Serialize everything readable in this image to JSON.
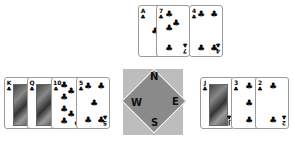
{
  "table": {
    "background": "#ffffff",
    "compass": {
      "north": "N",
      "south": "S",
      "east": "E",
      "west": "W",
      "outer_color": "#bdbdbd",
      "diamond_color": "#8a8a8a"
    }
  },
  "hands": {
    "north": {
      "cards": [
        {
          "rank": "A",
          "suit": "♣"
        },
        {
          "rank": "7",
          "suit": "♣"
        },
        {
          "rank": "4",
          "suit": "♣"
        }
      ]
    },
    "west": {
      "cards": [
        {
          "rank": "K",
          "suit": "♣"
        },
        {
          "rank": "Q",
          "suit": "♣"
        },
        {
          "rank": "10",
          "suit": "♣"
        },
        {
          "rank": "5",
          "suit": "♣"
        }
      ]
    },
    "east": {
      "cards": [
        {
          "rank": "J",
          "suit": "♣"
        },
        {
          "rank": "3",
          "suit": "♣"
        },
        {
          "rank": "2",
          "suit": "♣"
        }
      ]
    }
  }
}
